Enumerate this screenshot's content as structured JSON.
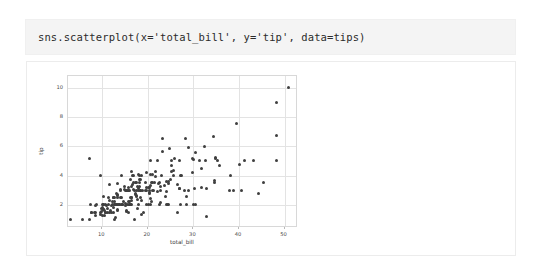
{
  "cell": {
    "code": "sns.scatterplot(x='total_bill', y='tip', data=tips)"
  },
  "chart_data": {
    "type": "scatter",
    "title": "",
    "xlabel": "total_bill",
    "ylabel": "tip",
    "xlim": [
      2.5,
      52.5
    ],
    "ylim": [
      0.55,
      10.8
    ],
    "xticks": [
      10,
      20,
      30,
      40,
      50
    ],
    "yticks": [
      2,
      4,
      6,
      8,
      10
    ],
    "grid": true,
    "legend": "none",
    "marker_color": "#3f3f3f",
    "series": [
      {
        "name": "tips",
        "x": [
          16.99,
          10.34,
          21.01,
          23.68,
          24.59,
          25.29,
          8.77,
          26.88,
          15.04,
          14.78,
          10.27,
          35.26,
          15.42,
          18.43,
          14.83,
          21.58,
          10.33,
          16.29,
          16.97,
          20.65,
          17.92,
          20.29,
          15.77,
          39.42,
          19.82,
          17.81,
          13.37,
          12.69,
          21.7,
          19.65,
          9.55,
          18.35,
          15.06,
          20.69,
          17.78,
          24.06,
          16.31,
          16.93,
          18.69,
          31.27,
          16.04,
          17.46,
          13.94,
          9.68,
          30.4,
          18.29,
          22.23,
          32.4,
          28.55,
          18.04,
          12.54,
          10.29,
          34.81,
          9.94,
          25.56,
          19.49,
          38.01,
          26.41,
          11.24,
          48.27,
          20.29,
          13.81,
          11.02,
          18.29,
          17.59,
          20.08,
          16.45,
          3.07,
          20.23,
          15.01,
          12.02,
          17.07,
          26.86,
          25.28,
          14.73,
          10.51,
          17.92,
          27.2,
          22.76,
          17.29,
          19.44,
          16.66,
          10.07,
          32.68,
          15.98,
          34.83,
          13.03,
          18.28,
          24.71,
          21.16,
          28.97,
          22.49,
          5.75,
          16.32,
          22.75,
          40.17,
          27.28,
          12.03,
          21.01,
          12.46,
          11.35,
          15.38,
          44.3,
          22.42,
          20.92,
          15.36,
          20.49,
          25.21,
          18.24,
          14.31,
          14.0,
          7.25,
          38.07,
          23.95,
          25.71,
          17.31,
          29.93,
          10.65,
          12.43,
          24.08,
          11.69,
          13.42,
          14.26,
          15.95,
          12.48,
          29.8,
          8.52,
          14.52,
          11.38,
          22.82,
          19.08,
          20.27,
          11.17,
          12.26,
          18.26,
          8.51,
          10.33,
          14.15,
          16.0,
          13.16,
          17.47,
          34.3,
          41.19,
          27.05,
          16.43,
          8.35,
          18.64,
          11.87,
          9.78,
          7.51,
          14.07,
          13.13,
          17.26,
          24.55,
          19.77,
          29.85,
          48.17,
          25.0,
          13.39,
          16.49,
          21.5,
          12.66,
          16.21,
          13.81,
          17.51,
          24.52,
          20.76,
          31.71,
          10.59,
          10.63,
          50.81,
          15.81,
          7.25,
          31.85,
          16.82,
          32.9,
          17.89,
          14.48,
          9.6,
          34.63,
          34.65,
          23.33,
          45.35,
          23.17,
          40.55,
          20.69,
          20.9,
          30.46,
          18.15,
          23.1,
          15.69,
          19.81,
          28.44,
          15.48,
          16.58,
          7.56,
          10.34,
          43.11,
          13.0,
          13.51,
          18.71,
          12.74,
          13.0,
          16.4,
          20.53,
          16.47,
          26.59,
          38.73,
          24.27,
          12.76,
          30.06,
          25.89,
          48.33,
          13.27,
          28.17,
          12.9,
          28.15,
          11.59,
          7.74,
          30.14,
          12.16,
          13.42,
          8.58,
          15.98,
          13.42,
          16.27,
          10.09,
          20.45,
          13.28,
          22.12,
          24.01,
          15.69,
          11.61,
          10.77,
          15.53,
          10.07,
          12.6,
          32.83,
          35.83,
          29.03,
          27.18,
          22.67,
          17.82,
          18.78
        ],
        "y": [
          1.01,
          1.66,
          3.5,
          3.31,
          3.61,
          4.71,
          2.0,
          3.12,
          1.96,
          3.23,
          1.71,
          5.0,
          1.57,
          3.0,
          3.02,
          3.92,
          1.67,
          3.71,
          3.5,
          3.35,
          4.08,
          2.75,
          2.23,
          7.58,
          3.18,
          2.34,
          2.0,
          2.0,
          4.3,
          3.0,
          1.45,
          2.5,
          3.0,
          2.45,
          3.27,
          3.6,
          2.0,
          3.07,
          2.31,
          5.0,
          2.24,
          2.54,
          3.06,
          1.32,
          5.6,
          3.0,
          5.0,
          6.0,
          2.05,
          3.0,
          2.5,
          2.6,
          5.2,
          1.56,
          4.34,
          3.51,
          3.0,
          1.5,
          1.76,
          6.73,
          3.21,
          2.0,
          1.98,
          3.76,
          2.64,
          3.15,
          2.47,
          1.0,
          2.01,
          2.09,
          1.97,
          3.0,
          3.14,
          5.0,
          2.2,
          1.25,
          3.08,
          4.0,
          3.0,
          2.71,
          3.0,
          3.4,
          1.83,
          5.0,
          2.03,
          5.17,
          2.0,
          4.0,
          5.85,
          3.0,
          3.0,
          3.5,
          1.0,
          4.3,
          3.25,
          4.73,
          4.0,
          1.5,
          3.0,
          1.5,
          2.5,
          3.0,
          2.8,
          3.48,
          4.08,
          1.64,
          4.06,
          4.29,
          3.76,
          4.0,
          3.0,
          1.0,
          4.0,
          2.55,
          4.0,
          3.5,
          5.07,
          1.5,
          1.8,
          2.92,
          2.31,
          1.68,
          2.5,
          2.0,
          2.52,
          4.2,
          1.48,
          2.0,
          2.0,
          2.18,
          1.5,
          2.83,
          1.5,
          2.0,
          3.25,
          1.25,
          2.0,
          2.0,
          2.0,
          2.75,
          3.5,
          6.7,
          5.0,
          5.0,
          2.3,
          1.5,
          1.36,
          1.63,
          1.73,
          2.0,
          2.5,
          2.0,
          2.74,
          2.0,
          2.0,
          5.14,
          5.0,
          3.75,
          2.61,
          2.0,
          3.5,
          2.5,
          2.0,
          2.0,
          3.0,
          3.48,
          2.24,
          4.5,
          1.61,
          2.0,
          10.0,
          3.16,
          5.15,
          3.18,
          4.0,
          3.11,
          2.0,
          2.0,
          4.0,
          3.55,
          3.68,
          5.65,
          3.5,
          6.5,
          3.0,
          5.0,
          3.5,
          2.0,
          3.5,
          4.0,
          1.5,
          4.19,
          2.56,
          2.02,
          4.0,
          1.44,
          2.0,
          5.0,
          2.0,
          2.0,
          4.0,
          2.0,
          2.0,
          2.5,
          2.0,
          3.23,
          3.41,
          3.0,
          2.03,
          2.23,
          2.0,
          5.16,
          9.0,
          2.5,
          6.5,
          1.1,
          3.0,
          1.5,
          1.44,
          3.09,
          2.2,
          3.48,
          1.92,
          3.0,
          1.58,
          2.5,
          2.0,
          3.0,
          2.72,
          2.88,
          2.0,
          3.0,
          3.39,
          1.47,
          3.0,
          1.25,
          1.0,
          1.17,
          4.67,
          5.92,
          2.0,
          2.0,
          1.75,
          3.0
        ]
      }
    ]
  }
}
